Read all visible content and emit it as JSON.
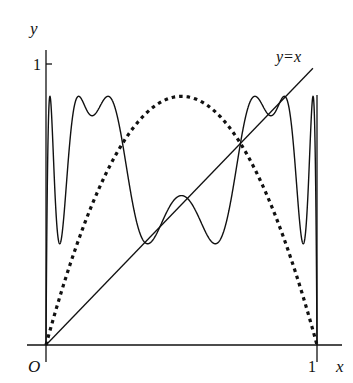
{
  "chart_data": {
    "type": "line",
    "title": "",
    "xlabel": "x",
    "ylabel": "y",
    "xlim": [
      0,
      1
    ],
    "ylim": [
      0,
      1
    ],
    "grid": false,
    "legend": "none",
    "x_ticks": [
      {
        "value": 1,
        "label": "1"
      }
    ],
    "y_ticks": [
      {
        "value": 1,
        "label": "1"
      }
    ],
    "origin_label": "O",
    "series": [
      {
        "name": "f(x) = r x (1 - x)",
        "style": "dotted-thick",
        "kind": "logistic-map",
        "r": 3.54,
        "iterations": 1,
        "peak": {
          "x": 0.5,
          "y": 0.885
        }
      },
      {
        "name": "f^4(x)",
        "style": "solid",
        "kind": "logistic-map",
        "r": 3.54,
        "iterations": 4,
        "approx_points": [
          [
            0.0,
            0.0
          ],
          [
            0.007,
            0.885
          ],
          [
            0.044,
            0.363
          ],
          [
            0.11,
            0.885
          ],
          [
            0.17,
            0.815
          ],
          [
            0.23,
            0.885
          ],
          [
            0.37,
            0.363
          ],
          [
            0.5,
            0.53
          ],
          [
            0.63,
            0.363
          ],
          [
            0.77,
            0.885
          ],
          [
            0.83,
            0.815
          ],
          [
            0.89,
            0.885
          ],
          [
            0.956,
            0.363
          ],
          [
            0.993,
            0.885
          ],
          [
            1.0,
            0.0
          ]
        ]
      },
      {
        "name": "y = x",
        "style": "solid",
        "kind": "identity",
        "x": [
          0,
          0.985
        ],
        "y": [
          0,
          0.985
        ]
      }
    ],
    "annotations": [
      {
        "text": "y=x",
        "x": 0.92,
        "y": 1.02
      }
    ],
    "vertical_lines": [
      {
        "x": 1
      }
    ]
  },
  "labels": {
    "y_axis": "y",
    "x_axis": "x",
    "origin": "O",
    "y_tick_1": "1",
    "x_tick_1": "1",
    "identity_label": "y=x"
  }
}
